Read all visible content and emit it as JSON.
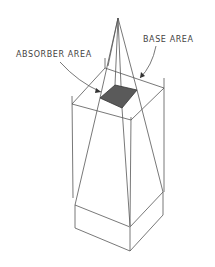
{
  "diagram": {
    "labels": {
      "absorber": "ABSORBER AREA",
      "base": "BASE AREA"
    },
    "colors": {
      "line": "#555555",
      "absorber_fill": "#5a5a5a",
      "text": "#444444"
    }
  }
}
